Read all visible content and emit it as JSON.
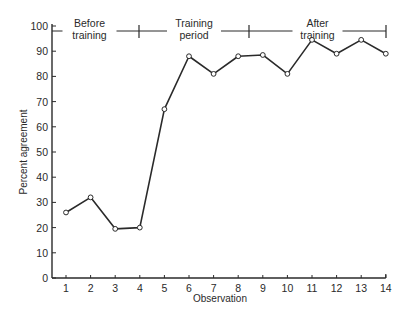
{
  "chart_data": {
    "type": "line",
    "title": "",
    "xlabel": "Observation",
    "ylabel": "Percent agreement",
    "x": [
      1,
      2,
      3,
      4,
      5,
      6,
      7,
      8,
      9,
      10,
      11,
      12,
      13,
      14
    ],
    "series": [
      {
        "name": "Percent agreement",
        "values": [
          26,
          32,
          19.5,
          20,
          67,
          88,
          81,
          88,
          88.5,
          81,
          94.5,
          89,
          94.5,
          89
        ]
      }
    ],
    "xticks": [
      "1",
      "2",
      "3",
      "4",
      "5",
      "6",
      "7",
      "8",
      "9",
      "10",
      "11",
      "12",
      "13",
      "14"
    ],
    "yticks": [
      "0",
      "10",
      "20",
      "30",
      "40",
      "50",
      "60",
      "70",
      "80",
      "90",
      "100"
    ],
    "xlim": [
      0.5,
      14
    ],
    "ylim": [
      0,
      100
    ],
    "grid": false,
    "legend": null,
    "markers": "open-circle",
    "annotations": [
      {
        "text_lines": [
          "Before",
          "training"
        ],
        "span": [
          0.5,
          4.0
        ],
        "y": 98
      },
      {
        "text_lines": [
          "Training",
          "period"
        ],
        "span": [
          4.0,
          8.5
        ],
        "y": 98
      },
      {
        "text_lines": [
          "After",
          "training"
        ],
        "span": [
          8.5,
          14
        ],
        "y": 98
      }
    ]
  },
  "colors": {
    "line": "#2a2a2a",
    "marker_fill": "#ffffff",
    "axis": "#2a2a2a"
  }
}
